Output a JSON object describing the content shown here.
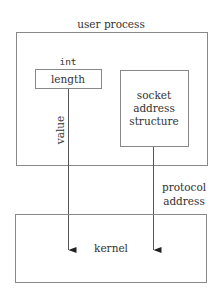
{
  "diagram": {
    "user_process": {
      "label": "user process"
    },
    "length_field": {
      "type_label": "int",
      "label": "length"
    },
    "socket_structure": {
      "lines": [
        "socket",
        "address",
        "structure"
      ]
    },
    "arrows": {
      "value": {
        "label": "value"
      },
      "protocol_address": {
        "lines": [
          "protocol",
          "address"
        ]
      }
    },
    "kernel": {
      "label": "kernel"
    },
    "colors": {
      "stroke": "#888888",
      "line": "#555555",
      "arrowhead": "#222222",
      "text": "#333333",
      "background": "#ffffff"
    }
  }
}
